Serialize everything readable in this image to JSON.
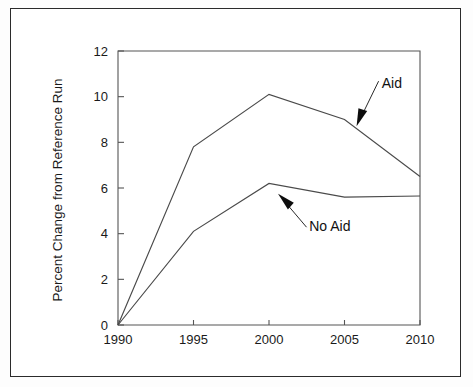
{
  "figure": {
    "border_color": "#2b2b2b",
    "line_color": "#4a4a4a",
    "background": "#ffffff"
  },
  "chart_data": {
    "type": "line",
    "title": "",
    "xlabel": "",
    "ylabel": "Percent Change from Reference Run",
    "categories": [
      "1990",
      "1995",
      "2000",
      "2005",
      "2010"
    ],
    "x": [
      1990,
      1995,
      2000,
      2005,
      2010
    ],
    "xlim": [
      1990,
      2010
    ],
    "ylim": [
      0,
      12
    ],
    "xticks": [
      "1990",
      "1995",
      "2000",
      "2005",
      "2010"
    ],
    "yticks": [
      "0",
      "2",
      "4",
      "6",
      "8",
      "10",
      "12"
    ],
    "grid": false,
    "legend_position": "inline-annotations",
    "series": [
      {
        "name": "Aid",
        "values": [
          0.0,
          7.8,
          10.1,
          9.0,
          6.5
        ]
      },
      {
        "name": "No Aid",
        "values": [
          0.0,
          4.1,
          6.2,
          5.6,
          5.65
        ]
      }
    ],
    "annotations": [
      {
        "text": "Aid",
        "target_x": 2005.8,
        "target_y": 8.7,
        "label_x": 2007.2,
        "label_y": 10.6
      },
      {
        "text": "No Aid",
        "target_x": 2000.6,
        "target_y": 5.75,
        "label_x": 2002.4,
        "label_y": 4.35
      }
    ]
  }
}
